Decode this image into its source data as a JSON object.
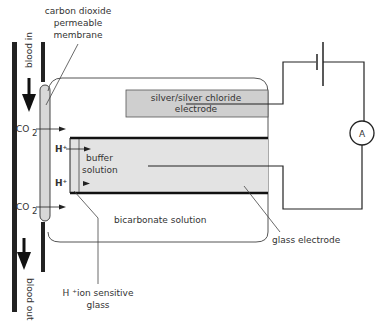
{
  "diagram": {
    "labels": {
      "membrane_line1": "carbon dioxide",
      "membrane_line2": "permeable",
      "membrane_line3": "membrane",
      "blood_in": "blood in",
      "blood_out": "blood out",
      "co2_top": "CO",
      "co2_top_sub": "2",
      "co2_bottom": "CO",
      "co2_bottom_sub": "2",
      "h_top": "H⁺",
      "h_bottom": "H⁺",
      "buffer_line1": "buffer",
      "buffer_line2": "solution",
      "bicarbonate": "bicarbonate solution",
      "silver_line1": "silver/silver chloride",
      "silver_line2": "electrode",
      "glass_electrode": "glass electrode",
      "hion_line1": "H ⁺ion sensitive",
      "hion_line2": "glass",
      "ammeter": "A"
    },
    "colors": {
      "electrode_fill": "#d0d0d0",
      "buffer_fill": "#e2e2e2",
      "line": "#222222",
      "outline": "#555555"
    }
  }
}
